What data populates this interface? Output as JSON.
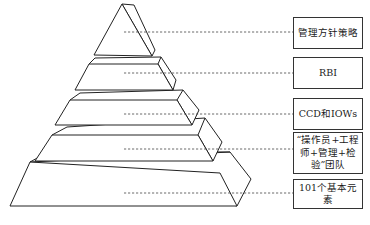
{
  "diagram": {
    "type": "pyramid",
    "tiers": [
      {
        "level": 1,
        "label": "管理方针策略"
      },
      {
        "level": 2,
        "label": "RBI"
      },
      {
        "level": 3,
        "label": "CCD和IOWs"
      },
      {
        "level": 4,
        "label": "“操作员+工程师+管理+检验”团队"
      },
      {
        "level": 5,
        "label": "101个基本元素"
      }
    ],
    "colors": {
      "stroke": "#222222",
      "fill": "#ffffff",
      "connector": "#444444"
    }
  }
}
